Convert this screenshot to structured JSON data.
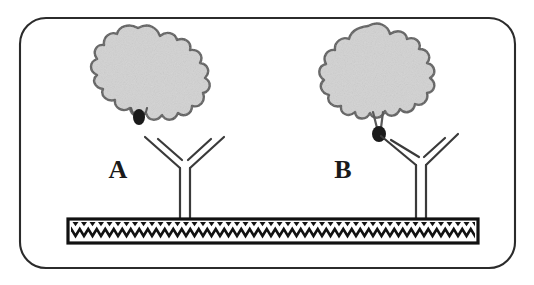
{
  "figure": {
    "border": {
      "shape": "rounded-rectangle",
      "stroke_color": "#2b2b2b",
      "fill_color": "#ffffff",
      "corner_radius": 26
    },
    "panels": [
      {
        "id": "A",
        "label": "A",
        "label_x": 118,
        "label_y": 175,
        "antigen": {
          "name": "antigen-blob",
          "fill_color": "#d2d2d2",
          "stroke_color": "#5a5a5a",
          "center_x": 140,
          "center_y": 78
        },
        "epitope": {
          "name": "epitope-dot",
          "color": "#1a1a1a",
          "x": 139,
          "y": 118,
          "rx": 6,
          "ry": 8,
          "state": "buried",
          "stalk": false
        },
        "antibody": {
          "name": "antibody-y",
          "stroke_color": "#3a3a3a",
          "stem_x": 184,
          "stem_top": 165,
          "stem_bottom": 220,
          "bound": false,
          "arm_tilt": "symmetric"
        }
      },
      {
        "id": "B",
        "label": "B",
        "label_x": 343,
        "label_y": 175,
        "antigen": {
          "name": "antigen-blob",
          "fill_color": "#d2d2d2",
          "stroke_color": "#5a5a5a",
          "center_x": 370,
          "center_y": 76
        },
        "epitope": {
          "name": "epitope-dot",
          "color": "#1a1a1a",
          "x": 379,
          "y": 133,
          "rx": 7,
          "ry": 8,
          "state": "exposed",
          "stalk": true
        },
        "antibody": {
          "name": "antibody-y",
          "stroke_color": "#3a3a3a",
          "stem_x": 420,
          "stem_top": 162,
          "stem_bottom": 220,
          "bound": true,
          "arm_tilt": "left-arm-raised"
        }
      }
    ],
    "substrate": {
      "name": "solid-phase-plate",
      "x": 68,
      "y": 219,
      "width": 410,
      "height": 24,
      "border_color": "#111111",
      "fill_color": "#ffffff",
      "pattern": "zigzag-hatch",
      "pattern_color": "#111111",
      "zigzag_period": 17
    }
  }
}
